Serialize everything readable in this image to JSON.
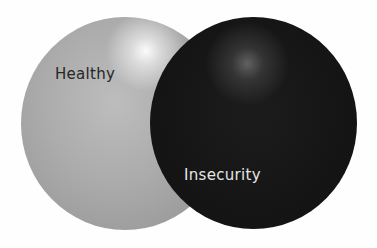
{
  "diagram": {
    "type": "venn",
    "sets": [
      {
        "label": "Healthy",
        "color": "#ababab",
        "text_color": "#262626"
      },
      {
        "label": "Insecurity",
        "color": "#151515",
        "text_color": "#e6e6e6"
      }
    ]
  }
}
